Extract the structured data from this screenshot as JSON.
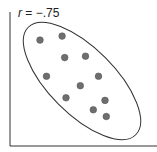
{
  "chart_data": {
    "type": "scatter",
    "title": "",
    "annotation": "r = −.75",
    "annotation_var": "r",
    "annotation_value": "= −.75",
    "xlabel": "",
    "ylabel": "",
    "grid": false,
    "legend": null,
    "xlim": [
      0,
      10
    ],
    "ylim": [
      0,
      10
    ],
    "points": [
      {
        "x": 2.0,
        "y": 7.9
      },
      {
        "x": 3.7,
        "y": 8.2
      },
      {
        "x": 3.9,
        "y": 6.6
      },
      {
        "x": 5.5,
        "y": 6.7
      },
      {
        "x": 2.5,
        "y": 5.2
      },
      {
        "x": 5.1,
        "y": 4.5
      },
      {
        "x": 6.5,
        "y": 5.2
      },
      {
        "x": 4.0,
        "y": 3.6
      },
      {
        "x": 7.0,
        "y": 3.4
      },
      {
        "x": 6.1,
        "y": 2.7
      },
      {
        "x": 7.1,
        "y": 2.2
      }
    ],
    "ellipse": {
      "cx": 82,
      "cy": 81,
      "rx": 76,
      "ry": 34,
      "rotate": 45
    },
    "colors": {
      "point": "#6e6e6e",
      "point_stroke": "#555555",
      "axis": "#333333",
      "ellipse": "#333333"
    }
  }
}
